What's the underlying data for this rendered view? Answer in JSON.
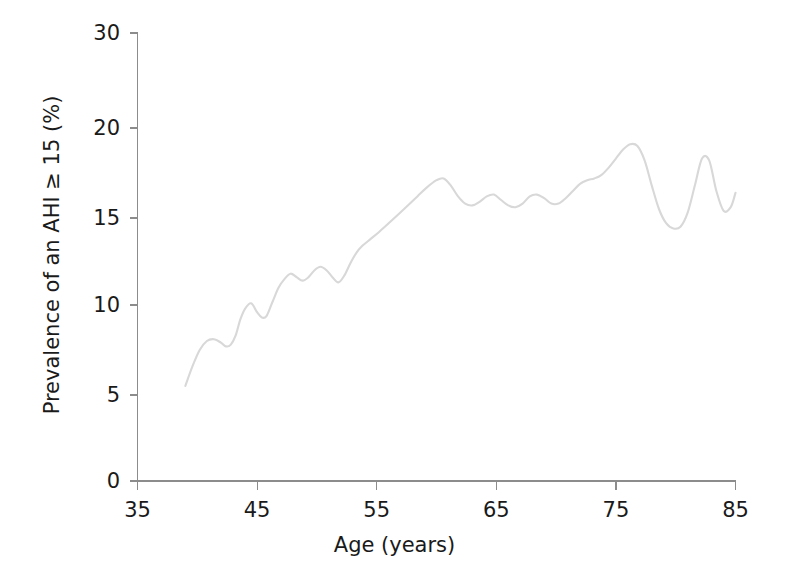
{
  "chart_data": {
    "type": "line",
    "title": "",
    "xlabel": "Age (years)",
    "ylabel": "Prevalence of an AHI ≥ 15 (%)",
    "xlim": [
      35,
      85
    ],
    "ylim": [
      0,
      30
    ],
    "grid": false,
    "legend": null,
    "xticks": [
      35,
      45,
      55,
      65,
      75,
      85
    ],
    "xtick_labels": [
      "35",
      "45",
      "55",
      "65",
      "75",
      "85"
    ],
    "yticks": [
      0,
      5,
      10,
      15,
      20,
      30
    ],
    "ytick_labels": [
      "0",
      "5",
      "10",
      "15",
      "20",
      "30"
    ],
    "y_axis_note": "non-linear: 0-20 linear, 20-30 compressed",
    "series": [
      {
        "name": "Prevalence of an AHI ≥ 15 (%)",
        "color": "#d8d8d8",
        "x": [
          39.0,
          39.6,
          40.2,
          40.8,
          41.4,
          42.0,
          42.4,
          42.8,
          43.2,
          43.6,
          44.0,
          44.5,
          45.0,
          45.4,
          45.8,
          46.3,
          46.8,
          47.3,
          47.8,
          48.3,
          48.8,
          49.3,
          49.8,
          50.3,
          50.8,
          51.3,
          51.8,
          52.3,
          52.8,
          53.3,
          53.8,
          54.5,
          55.2,
          56.0,
          56.8,
          57.6,
          58.4,
          59.2,
          60.0,
          60.6,
          61.2,
          61.8,
          62.4,
          63.0,
          63.6,
          64.2,
          64.8,
          65.4,
          66.0,
          66.6,
          67.2,
          67.8,
          68.4,
          69.0,
          69.6,
          70.2,
          70.8,
          71.4,
          72.0,
          72.6,
          73.2,
          73.8,
          74.4,
          75.0,
          75.6,
          76.2,
          76.8,
          77.4,
          78.0,
          78.6,
          79.2,
          79.8,
          80.4,
          81.0,
          81.6,
          82.2,
          82.8,
          83.4,
          84.0,
          84.6,
          85.0
        ],
        "y": [
          5.5,
          6.6,
          7.5,
          8.0,
          8.1,
          7.9,
          7.7,
          7.8,
          8.3,
          9.2,
          9.8,
          10.1,
          9.6,
          9.3,
          9.4,
          10.2,
          11.0,
          11.5,
          11.8,
          11.6,
          11.4,
          11.6,
          12.0,
          12.2,
          12.0,
          11.6,
          11.3,
          11.7,
          12.4,
          13.0,
          13.4,
          13.8,
          14.2,
          14.7,
          15.2,
          15.7,
          16.2,
          16.7,
          17.1,
          17.2,
          16.8,
          16.2,
          15.8,
          15.7,
          15.9,
          16.2,
          16.3,
          16.0,
          15.7,
          15.6,
          15.8,
          16.2,
          16.3,
          16.1,
          15.8,
          15.8,
          16.1,
          16.5,
          16.9,
          17.1,
          17.2,
          17.4,
          17.8,
          18.3,
          18.8,
          19.1,
          19.0,
          18.2,
          16.8,
          15.5,
          14.7,
          14.4,
          14.5,
          15.3,
          16.8,
          18.3,
          18.2,
          16.5,
          15.4,
          15.6,
          16.4
        ],
        "x_end_label": 85
      }
    ],
    "notable_points": {
      "start": {
        "age": 39,
        "value": 5.5
      },
      "local_peak_1": {
        "age": 41.4,
        "value": 8.1
      },
      "local_peak_2": {
        "age": 44.0,
        "value": 9.8
      },
      "local_peak_3": {
        "age": 47.8,
        "value": 11.8
      },
      "local_peak_4": {
        "age": 50.3,
        "value": 12.2
      },
      "plateau_peak": {
        "age": 60.0,
        "value": 17.2
      },
      "max_peak": {
        "age": 76.0,
        "value": 19.1
      },
      "dip": {
        "age": 79.8,
        "value": 14.4
      },
      "late_spike": {
        "age": 82.2,
        "value": 18.3
      },
      "end": {
        "age": 85,
        "value": 16.4
      }
    }
  },
  "axis": {
    "x_label": "Age (years)",
    "y_label": "Prevalence of an AHI ≥ 15 (%)"
  }
}
